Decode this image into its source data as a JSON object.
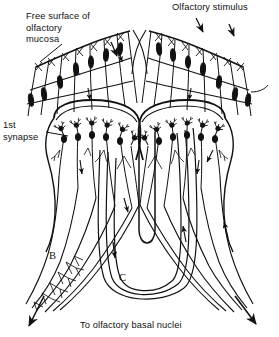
{
  "figure": {
    "name": "olfactory-pathway-diagram",
    "kind": "anatomical-line-drawing",
    "ink_color": "#111111",
    "background_color": "#ffffff",
    "width": 279,
    "height": 337,
    "symmetry": "bilateral-mirrored-about-vertical-midline"
  },
  "labels": {
    "free_surface": "Free surface of\nolfactory\nmucosa",
    "olfactory_stimulus": "Olfactory stimulus",
    "first_synapse": "1st\nsynapse",
    "to_basal_nuclei": "To olfactory basal nuclei",
    "letter_a": "A",
    "letter_b": "B",
    "letter_c": "C"
  },
  "structures": [
    {
      "id": "olfactory-mucosa-left",
      "label_ref": "free_surface",
      "letter": "A",
      "description": "Left olfactory mucosa sheet with receptor cell bodies and cilia bristles"
    },
    {
      "id": "olfactory-mucosa-right",
      "label_ref": "olfactory_stimulus",
      "description": "Right olfactory mucosa sheet receiving odorant stimulus arrows"
    },
    {
      "id": "glomerular-layer-left",
      "label_ref": "first_synapse",
      "description": "Left olfactory bulb glomeruli where receptor axons meet mitral cell dendrites"
    },
    {
      "id": "glomerular-layer-right",
      "description": "Right olfactory bulb glomeruli, mirror of left"
    },
    {
      "id": "lateral-olfactory-tract-left",
      "letter": "B",
      "label_ref": "to_basal_nuclei",
      "description": "Left mitral axon bundle converging and exiting to olfactory basal nuclei"
    },
    {
      "id": "lateral-olfactory-tract-right",
      "description": "Right mitral axon bundle converging and exiting to olfactory basal nuclei"
    },
    {
      "id": "commissural-bundle",
      "letter": "C",
      "description": "U-shaped commissural fiber bundle crossing the midline between both bulbs"
    },
    {
      "id": "midline-septum",
      "description": "Central vertical cleft separating the two olfactory bulbs"
    }
  ],
  "flow_arrows": {
    "stimulus_inbound_count": 3,
    "intramucosal_downward_count": 2,
    "bulb_outflow_count": 4,
    "tract_terminal_count": 2,
    "commissural_count": 2,
    "direction_note": "all arrowheads point away from mucosa toward basal nuclei"
  }
}
